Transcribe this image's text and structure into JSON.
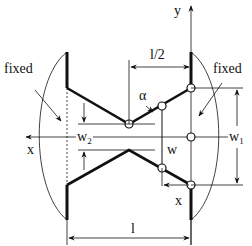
{
  "diagram": {
    "type": "mechanics-schematic",
    "labels": {
      "fixed_left": "fixed",
      "fixed_right": "fixed",
      "y_axis": "y",
      "x_axis_left": "x",
      "x_axis_bottom": "x",
      "half_length": "l/2",
      "length": "l",
      "alpha": "α",
      "w": "w",
      "w1_base": "w",
      "w1_sub": "1",
      "w2_base": "w",
      "w2_sub": "2"
    },
    "colors": {
      "stroke": "#111111",
      "background": "#ffffff"
    }
  }
}
